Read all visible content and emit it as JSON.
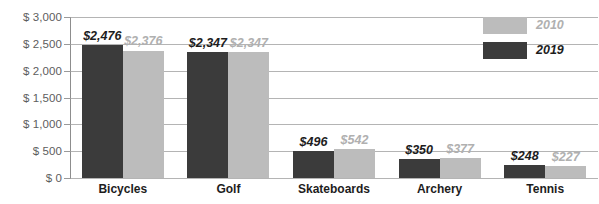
{
  "chart_data": {
    "type": "bar",
    "title": "",
    "subtitle": "",
    "xlabel": "",
    "ylabel": "",
    "categories": [
      "Bicycles",
      "Golf",
      "Skateboards",
      "Archery",
      "Tennis"
    ],
    "series": [
      {
        "name": "2019",
        "color": "#3b3b3b",
        "values": [
          2476,
          2347,
          496,
          350,
          248
        ],
        "value_labels": [
          "$2,476",
          "$2,347",
          "$496",
          "$350",
          "$248"
        ]
      },
      {
        "name": "2010",
        "color": "#bcbcbc",
        "values": [
          2376,
          2347,
          542,
          377,
          227
        ],
        "value_labels": [
          "$2,376",
          "$2,347",
          "$542",
          "$377",
          "$227"
        ]
      }
    ],
    "ylim": [
      0,
      3000
    ],
    "ytick_values": [
      0,
      500,
      1000,
      1500,
      2000,
      2500,
      3000
    ],
    "ytick_labels": [
      "$ 0",
      "$ 500",
      "$ 1,000",
      "$ 1,500",
      "$ 2,000",
      "$ 2,500",
      "$ 3,000"
    ],
    "grid": true,
    "legend_position": "top-right",
    "legend": [
      {
        "label": "2010",
        "color": "#bcbcbc"
      },
      {
        "label": "2019",
        "color": "#3b3b3b"
      }
    ]
  }
}
